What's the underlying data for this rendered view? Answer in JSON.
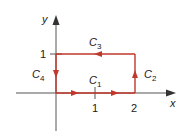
{
  "diagram": {
    "axes": {
      "x_label": "x",
      "y_label": "y",
      "x_ticks": [
        "1",
        "2"
      ],
      "y_ticks": [
        "1"
      ]
    },
    "curves": [
      {
        "id": "C1",
        "name": "C",
        "sub": "1",
        "from": [
          0,
          0
        ],
        "to": [
          2,
          0
        ],
        "direction": "right"
      },
      {
        "id": "C2",
        "name": "C",
        "sub": "2",
        "from": [
          2,
          0
        ],
        "to": [
          2,
          1
        ],
        "direction": "up"
      },
      {
        "id": "C3",
        "name": "C",
        "sub": "3",
        "from": [
          2,
          1
        ],
        "to": [
          0,
          1
        ],
        "direction": "left"
      },
      {
        "id": "C4",
        "name": "C",
        "sub": "4",
        "from": [
          0,
          1
        ],
        "to": [
          0,
          0
        ],
        "direction": "down"
      }
    ],
    "colors": {
      "path": "#c0392b",
      "axis": "#333333",
      "text": "#1a1a1a"
    }
  }
}
